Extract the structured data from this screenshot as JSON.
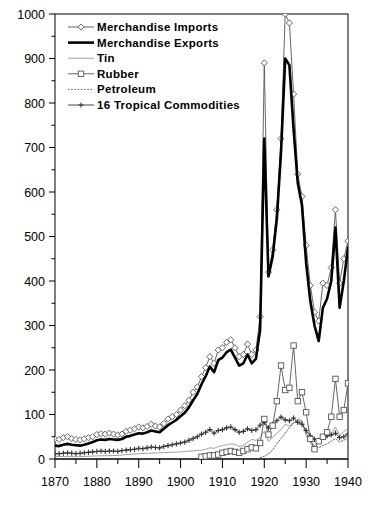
{
  "chart_data": {
    "type": "line",
    "title": "",
    "xlabel": "",
    "ylabel": "",
    "xlim": [
      1870,
      1940
    ],
    "ylim": [
      0,
      1000
    ],
    "grid": false,
    "legend_position": "top-left",
    "xticks": [
      1870,
      1880,
      1890,
      1900,
      1910,
      1920,
      1930,
      1940
    ],
    "xtick_labels": [
      "1870",
      "1880",
      "1890",
      "1900",
      "1910",
      "1920",
      "1930",
      "1940"
    ],
    "x_minor_ticks": [
      1875,
      1885,
      1895,
      1905,
      1915,
      1925,
      1935
    ],
    "yticks": [
      0,
      100,
      200,
      300,
      400,
      500,
      600,
      700,
      800,
      900,
      1000
    ],
    "ytick_labels": [
      "0",
      "100",
      "200",
      "300",
      "400",
      "500",
      "600",
      "700",
      "800",
      "900",
      "1000"
    ],
    "y_minor_ticks": [
      50,
      150,
      250,
      350,
      450,
      550,
      650,
      750,
      850,
      950
    ],
    "series": [
      {
        "name": "Merchandise Imports",
        "marker": "diamond",
        "linestyle": "solid-thin",
        "color": "#555555",
        "x": [
          1870,
          1871,
          1872,
          1873,
          1874,
          1875,
          1876,
          1877,
          1878,
          1879,
          1880,
          1881,
          1882,
          1883,
          1884,
          1885,
          1886,
          1887,
          1888,
          1889,
          1890,
          1891,
          1892,
          1893,
          1894,
          1895,
          1896,
          1897,
          1898,
          1899,
          1900,
          1901,
          1902,
          1903,
          1904,
          1905,
          1906,
          1907,
          1908,
          1909,
          1910,
          1911,
          1912,
          1913,
          1914,
          1915,
          1916,
          1917,
          1918,
          1919,
          1920,
          1921,
          1922,
          1923,
          1924,
          1925,
          1926,
          1927,
          1928,
          1929,
          1930,
          1931,
          1932,
          1933,
          1934,
          1935,
          1936,
          1937,
          1938,
          1939,
          1940
        ],
        "values": [
          45,
          44,
          48,
          50,
          46,
          44,
          43,
          45,
          48,
          50,
          55,
          57,
          56,
          58,
          56,
          54,
          56,
          62,
          65,
          68,
          72,
          70,
          73,
          78,
          74,
          72,
          80,
          90,
          95,
          100,
          110,
          120,
          132,
          150,
          162,
          185,
          205,
          230,
          215,
          245,
          250,
          262,
          268,
          250,
          230,
          235,
          258,
          235,
          245,
          320,
          890,
          420,
          470,
          560,
          720,
          1000,
          980,
          820,
          640,
          590,
          480,
          390,
          330,
          310,
          395,
          390,
          430,
          560,
          395,
          450,
          490
        ]
      },
      {
        "name": "Merchandise Exports",
        "marker": "none",
        "linestyle": "solid-thick",
        "color": "#000000",
        "x": [
          1870,
          1871,
          1872,
          1873,
          1874,
          1875,
          1876,
          1877,
          1878,
          1879,
          1880,
          1881,
          1882,
          1883,
          1884,
          1885,
          1886,
          1887,
          1888,
          1889,
          1890,
          1891,
          1892,
          1893,
          1894,
          1895,
          1896,
          1897,
          1898,
          1899,
          1900,
          1901,
          1902,
          1903,
          1904,
          1905,
          1906,
          1907,
          1908,
          1909,
          1910,
          1911,
          1912,
          1913,
          1914,
          1915,
          1916,
          1917,
          1918,
          1919,
          1920,
          1921,
          1922,
          1923,
          1924,
          1925,
          1926,
          1927,
          1928,
          1929,
          1930,
          1931,
          1932,
          1933,
          1934,
          1935,
          1936,
          1937,
          1938,
          1939,
          1940
        ],
        "values": [
          30,
          29,
          32,
          34,
          32,
          31,
          30,
          32,
          35,
          38,
          42,
          44,
          43,
          45,
          44,
          43,
          45,
          50,
          52,
          55,
          58,
          57,
          60,
          64,
          62,
          60,
          68,
          76,
          82,
          88,
          96,
          104,
          116,
          132,
          146,
          168,
          186,
          208,
          195,
          222,
          228,
          240,
          246,
          228,
          210,
          215,
          235,
          215,
          225,
          290,
          720,
          410,
          455,
          540,
          690,
          900,
          885,
          740,
          620,
          570,
          440,
          355,
          300,
          265,
          340,
          360,
          400,
          520,
          340,
          400,
          475
        ]
      },
      {
        "name": "Tin",
        "marker": "none",
        "linestyle": "solid-hairline",
        "color": "#8a8a8a",
        "x": [
          1870,
          1875,
          1880,
          1885,
          1890,
          1895,
          1900,
          1905,
          1906,
          1907,
          1908,
          1909,
          1910,
          1911,
          1912,
          1913,
          1914,
          1915,
          1916,
          1917,
          1918,
          1919,
          1920,
          1921,
          1922,
          1923,
          1924,
          1925,
          1926,
          1927,
          1928,
          1929,
          1930,
          1931,
          1932,
          1933,
          1934,
          1935,
          1936,
          1937,
          1938,
          1939,
          1940
        ],
        "values": [
          6,
          5,
          7,
          8,
          12,
          14,
          16,
          20,
          22,
          25,
          24,
          28,
          30,
          32,
          34,
          33,
          28,
          30,
          38,
          44,
          42,
          48,
          62,
          40,
          48,
          58,
          66,
          78,
          74,
          80,
          90,
          86,
          52,
          38,
          30,
          40,
          48,
          50,
          56,
          72,
          52,
          62,
          68
        ]
      },
      {
        "name": "Rubber",
        "marker": "square",
        "linestyle": "solid-thin",
        "color": "#555555",
        "x": [
          1905,
          1906,
          1907,
          1908,
          1909,
          1910,
          1911,
          1912,
          1913,
          1914,
          1915,
          1916,
          1917,
          1918,
          1919,
          1920,
          1921,
          1922,
          1923,
          1924,
          1925,
          1926,
          1927,
          1928,
          1929,
          1930,
          1931,
          1932,
          1933,
          1934,
          1935,
          1936,
          1937,
          1938,
          1939,
          1940
        ],
        "values": [
          5,
          6,
          8,
          8,
          10,
          14,
          16,
          18,
          16,
          14,
          18,
          22,
          26,
          24,
          36,
          90,
          55,
          75,
          130,
          210,
          155,
          160,
          255,
          130,
          150,
          105,
          45,
          22,
          40,
          50,
          60,
          95,
          180,
          95,
          110,
          170
        ]
      },
      {
        "name": "Petroleum",
        "marker": "none",
        "linestyle": "dotted",
        "color": "#666666",
        "x": [
          1919,
          1920,
          1921,
          1922,
          1923,
          1924,
          1925,
          1926,
          1927,
          1928,
          1929,
          1930,
          1931,
          1932,
          1933,
          1934,
          1935,
          1936,
          1937,
          1938,
          1939,
          1940
        ],
        "values": [
          3,
          6,
          12,
          20,
          34,
          46,
          58,
          70,
          82,
          86,
          84,
          60,
          38,
          24,
          26,
          30,
          34,
          40,
          46,
          38,
          42,
          48
        ]
      },
      {
        "name": "16 Tropical Commodities",
        "marker": "plus",
        "linestyle": "solid-thin",
        "color": "#333333",
        "x": [
          1870,
          1871,
          1872,
          1873,
          1874,
          1875,
          1876,
          1877,
          1878,
          1879,
          1880,
          1881,
          1882,
          1883,
          1884,
          1885,
          1886,
          1887,
          1888,
          1889,
          1890,
          1891,
          1892,
          1893,
          1894,
          1895,
          1896,
          1897,
          1898,
          1899,
          1900,
          1901,
          1902,
          1903,
          1904,
          1905,
          1906,
          1907,
          1908,
          1909,
          1910,
          1911,
          1912,
          1913,
          1914,
          1915,
          1916,
          1917,
          1918,
          1919,
          1920,
          1921,
          1922,
          1923,
          1924,
          1925,
          1926,
          1927,
          1928,
          1929,
          1930,
          1931,
          1932,
          1933,
          1934,
          1935,
          1936,
          1937,
          1938,
          1939,
          1940
        ],
        "values": [
          12,
          12,
          13,
          14,
          13,
          12,
          13,
          14,
          15,
          16,
          17,
          18,
          17,
          18,
          18,
          17,
          19,
          20,
          21,
          22,
          24,
          23,
          25,
          27,
          26,
          25,
          28,
          30,
          32,
          34,
          36,
          38,
          42,
          46,
          50,
          56,
          60,
          66,
          58,
          64,
          66,
          70,
          72,
          66,
          60,
          62,
          68,
          64,
          66,
          76,
          82,
          70,
          78,
          86,
          94,
          88,
          86,
          92,
          82,
          78,
          64,
          52,
          44,
          42,
          50,
          52,
          54,
          58,
          48,
          50,
          56
        ]
      }
    ]
  },
  "legend": {
    "items": [
      {
        "label": "Merchandise Imports",
        "key": "imports"
      },
      {
        "label": "Merchandise Exports",
        "key": "exports"
      },
      {
        "label": "Tin",
        "key": "tin"
      },
      {
        "label": "Rubber",
        "key": "rubber"
      },
      {
        "label": "Petroleum",
        "key": "petroleum"
      },
      {
        "label": "16 Tropical Commodities",
        "key": "tropical"
      }
    ]
  }
}
